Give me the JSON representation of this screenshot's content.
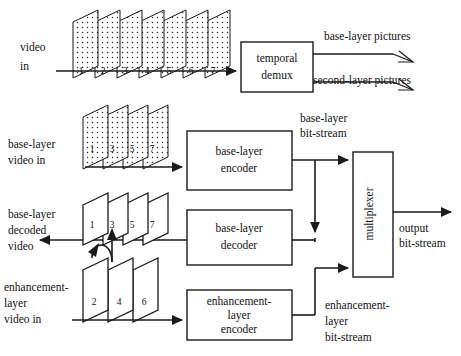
{
  "figure": {
    "background_color": "#ffffff",
    "line_color": "#1a1a1a"
  },
  "labels": {
    "video_in": "video\nin",
    "video_in_line1": "video",
    "video_in_line2": "in",
    "base_layer_video_in_line1": "base-layer",
    "base_layer_video_in_line2": "video in",
    "base_layer_decoded_line1": "base-layer",
    "base_layer_decoded_line2": "decoded",
    "base_layer_decoded_line3": "video",
    "enhancement_video_in_line1": "enhancement-",
    "enhancement_video_in_line2": "layer",
    "enhancement_video_in_line3": "video in",
    "base_layer_pictures": "base-layer pictures",
    "second_layer_pictures": "second-layer pictures",
    "base_layer_bitstream_line1": "base-layer",
    "base_layer_bitstream_line2": "bit-stream",
    "enhancement_bitstream_line1": "enhancement-",
    "enhancement_bitstream_line2": "layer",
    "enhancement_bitstream_line3": "bit-stream",
    "output_bitstream_line1": "output",
    "output_bitstream_line2": "bit-stream"
  },
  "boxes": [
    {
      "id": "temporal-demux",
      "lines": [
        "temporal",
        "demux"
      ],
      "x": 241,
      "y": 42,
      "w": 72,
      "h": 50
    },
    {
      "id": "base-layer-encoder",
      "lines": [
        "base-layer",
        "encoder"
      ],
      "x": 187,
      "y": 131,
      "w": 105,
      "h": 59
    },
    {
      "id": "base-layer-decoder",
      "lines": [
        "base-layer",
        "decoder"
      ],
      "x": 187,
      "y": 210,
      "w": 105,
      "h": 55
    },
    {
      "id": "enhancement-layer-encoder",
      "lines": [
        "enhancement-",
        "layer",
        "encoder"
      ],
      "x": 187,
      "y": 290,
      "w": 105,
      "h": 50
    },
    {
      "id": "multiplexer",
      "lines": [
        "multiplexer"
      ],
      "x": 353,
      "y": 152,
      "w": 40,
      "h": 125,
      "vertical_text": true
    }
  ],
  "frame_stacks": [
    {
      "id": "input-video-frames",
      "style": "dotted",
      "numbers": [
        "1",
        "2",
        "3",
        "4",
        "5",
        "6",
        "7"
      ],
      "x": 72,
      "y": 10,
      "count": 7
    },
    {
      "id": "base-layer-video-frames",
      "style": "dotted",
      "numbers": [
        "1",
        "3",
        "5",
        "7"
      ],
      "x": 84,
      "y": 105,
      "count": 4
    },
    {
      "id": "base-layer-decoded-frames",
      "style": "plain",
      "numbers": [
        "1",
        "3",
        "5",
        "7"
      ],
      "x": 84,
      "y": 193,
      "count": 4
    },
    {
      "id": "enhancement-layer-frames",
      "style": "plain",
      "numbers": [
        "2",
        "4",
        "6"
      ],
      "x": 84,
      "y": 258,
      "count": 3
    }
  ]
}
